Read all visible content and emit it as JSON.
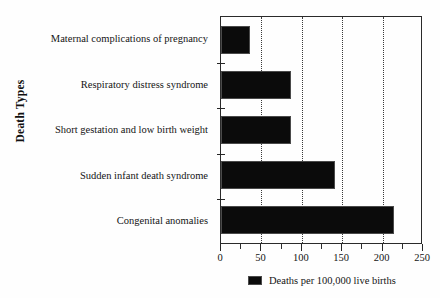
{
  "chart_data": {
    "type": "bar",
    "orientation": "horizontal",
    "title": "",
    "xlabel": "",
    "ylabel": "Death Types",
    "categories": [
      "Maternal complications of pregnancy",
      "Respiratory distress syndrome",
      "Short gestation and low birth weight",
      "Sudden infant death syndrome",
      "Congenital anomalies"
    ],
    "values": [
      36,
      87,
      87,
      141,
      214
    ],
    "series": [
      {
        "name": "Deaths per 100,000 live births",
        "values": [
          36,
          87,
          87,
          141,
          214
        ],
        "color": "#0b0b0b"
      }
    ],
    "xlim": [
      0,
      250
    ],
    "xticks": [
      0,
      50,
      100,
      150,
      200,
      250
    ],
    "xtick_labels": [
      "0",
      "50",
      "100",
      "150",
      "200",
      "250"
    ],
    "xminor_ticks": [
      25,
      75,
      125,
      175,
      225
    ],
    "grid": "vertical-dotted",
    "legend_position": "bottom"
  },
  "axes": {
    "y_title": "Death Types",
    "x_tick_labels": [
      "0",
      "50",
      "100",
      "150",
      "200",
      "250"
    ]
  },
  "legend": {
    "label": "Deaths per 100,000 live births",
    "swatch_color": "#0b0b0b"
  },
  "colors": {
    "bar": "#0b0b0b",
    "frame": "#2a2a2a",
    "grid": "#3a3a3a",
    "background": "#fefefe"
  }
}
